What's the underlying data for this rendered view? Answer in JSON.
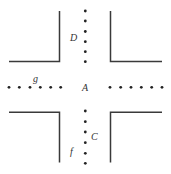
{
  "diagram": {
    "title": "",
    "colors": {
      "wall": "#3a3a3a",
      "dot": "#222222",
      "label": "#333333",
      "background": "#ffffff"
    },
    "labels": [
      {
        "id": "D",
        "text": "D",
        "x": 70,
        "y": 41
      },
      {
        "id": "g",
        "text": "g",
        "x": 33,
        "y": 82
      },
      {
        "id": "A",
        "text": "A",
        "x": 82,
        "y": 91
      },
      {
        "id": "C",
        "text": "C",
        "x": 91,
        "y": 140
      },
      {
        "id": "f",
        "text": "f",
        "x": 70,
        "y": 155
      }
    ],
    "walls": [
      {
        "name": "top-left-corner",
        "points": "59.5,11 59.5,61.5 9,61.5"
      },
      {
        "name": "top-right-corner",
        "points": "110.5,11 110.5,61.5 162,61.5"
      },
      {
        "name": "bottom-left-corner",
        "points": "9,112.3 59.5,112.3 59.5,162.5"
      },
      {
        "name": "bottom-right-corner",
        "points": "162,112.3 110.5,112.3 110.5,162.5"
      }
    ],
    "dot_rows": {
      "top": {
        "x": 85.3,
        "ys": [
          11,
          21,
          31.5,
          41.7,
          51.7,
          61.7
        ]
      },
      "bottom": {
        "x": 85.3,
        "ys": [
          111,
          121.7,
          132,
          142.7,
          153.3,
          163.3
        ]
      },
      "left": {
        "y": 87.3,
        "xs": [
          9,
          19.3,
          30,
          40.3,
          50.7,
          60.7
        ]
      },
      "right": {
        "y": 87.3,
        "xs": [
          110,
          120.7,
          131,
          141.3,
          151.7,
          162
        ]
      }
    },
    "dot_radius": 1.4,
    "wall_width": 1.5
  }
}
